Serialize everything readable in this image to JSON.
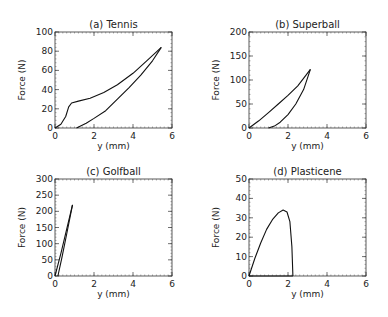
{
  "chart_data": [
    {
      "type": "line",
      "title": "(a) Tennis",
      "xlabel": "y (mm)",
      "ylabel": "Force (N)",
      "xlim": [
        0,
        6
      ],
      "ylim": [
        0,
        100
      ],
      "xticks": [
        0,
        2,
        4,
        6
      ],
      "yticks": [
        0,
        20,
        40,
        60,
        80,
        100
      ],
      "series": [
        {
          "name": "loading",
          "x": [
            0,
            0.3,
            0.55,
            0.7,
            0.85,
            1.2,
            1.8,
            2.5,
            3.2,
            4.0,
            4.7,
            5.45
          ],
          "y": [
            0,
            4,
            12,
            22,
            26,
            28,
            31,
            37,
            45,
            57,
            70,
            84
          ]
        },
        {
          "name": "unloading",
          "x": [
            5.45,
            5.0,
            4.4,
            3.8,
            3.2,
            2.6,
            2.0,
            1.6,
            1.1
          ],
          "y": [
            84,
            70,
            55,
            42,
            30,
            18,
            10,
            5,
            0
          ]
        }
      ]
    },
    {
      "type": "line",
      "title": "(b) Superball",
      "xlabel": "y (mm)",
      "ylabel": "Force (N)",
      "xlim": [
        0,
        6
      ],
      "ylim": [
        0,
        200
      ],
      "xticks": [
        0,
        2,
        4,
        6
      ],
      "yticks": [
        0,
        50,
        100,
        150,
        200
      ],
      "series": [
        {
          "name": "loading",
          "x": [
            0,
            0.5,
            1.0,
            1.5,
            2.0,
            2.5,
            3.15
          ],
          "y": [
            0,
            15,
            32,
            50,
            68,
            88,
            122
          ]
        },
        {
          "name": "unloading",
          "x": [
            3.15,
            2.8,
            2.4,
            2.0,
            1.6,
            1.3,
            1.0
          ],
          "y": [
            122,
            80,
            50,
            28,
            12,
            4,
            0
          ]
        }
      ]
    },
    {
      "type": "line",
      "title": "(c) Golfball",
      "xlabel": "y (mm)",
      "ylabel": "Force (N)",
      "xlim": [
        0,
        6
      ],
      "ylim": [
        0,
        300
      ],
      "xticks": [
        0,
        2,
        4,
        6
      ],
      "yticks": [
        0,
        50,
        100,
        150,
        200,
        250,
        300
      ],
      "series": [
        {
          "name": "loading",
          "x": [
            0,
            0.3,
            0.6,
            0.9
          ],
          "y": [
            0,
            70,
            145,
            220
          ]
        },
        {
          "name": "unloading",
          "x": [
            0.9,
            0.6,
            0.35,
            0.15
          ],
          "y": [
            220,
            130,
            55,
            0
          ]
        }
      ]
    },
    {
      "type": "line",
      "title": "(d) Plasticene",
      "xlabel": "y (mm)",
      "ylabel": "Force (N)",
      "xlim": [
        0,
        6
      ],
      "ylim": [
        0,
        50
      ],
      "xticks": [
        0,
        2,
        4,
        6
      ],
      "yticks": [
        0,
        10,
        20,
        30,
        40,
        50
      ],
      "series": [
        {
          "name": "loading",
          "x": [
            0,
            0.3,
            0.6,
            0.9,
            1.2,
            1.5,
            1.75,
            1.95,
            2.1,
            2.2,
            2.25
          ],
          "y": [
            0,
            9,
            17,
            24,
            29,
            32.5,
            34,
            33,
            28,
            15,
            0
          ]
        },
        {
          "name": "unloading",
          "x": [
            2.25,
            0
          ],
          "y": [
            0,
            0
          ]
        }
      ]
    }
  ]
}
